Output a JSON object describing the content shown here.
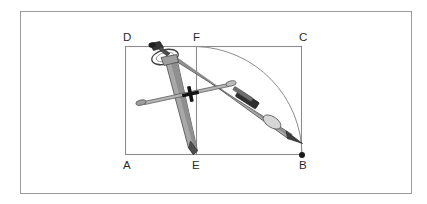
{
  "figure": {
    "background_color": "#ffffff",
    "border": {
      "name": "outer-frame",
      "color": "#9a9a9a",
      "x": 20,
      "y": 11,
      "width": 391,
      "height": 182
    },
    "rectangle": {
      "name": "rectangle-abcd",
      "stroke_color": "#8d8d8d",
      "left": 125,
      "top": 46,
      "right": 302,
      "bottom": 155
    },
    "segment_ef": {
      "name": "segment-ef",
      "stroke_color": "#8d8d8d",
      "x": 196,
      "y_top": 46,
      "y_bottom": 155
    },
    "arc": {
      "name": "compass-arc-fb",
      "stroke_color": "#8d8d8d",
      "center_label": "E",
      "from_label": "F",
      "to_label": "B",
      "center_x": 196,
      "center_y": 155,
      "radius": 109
    },
    "point_marker": {
      "name": "point-b-dot",
      "label": "B",
      "color": "#1a1a1a",
      "x": 302,
      "y": 155,
      "r": 3.0
    },
    "labels": [
      {
        "id": "label-d",
        "text": "D",
        "x": 123,
        "y": 41,
        "anchor": "start"
      },
      {
        "id": "label-f",
        "text": "F",
        "x": 193,
        "y": 41,
        "anchor": "start"
      },
      {
        "id": "label-c",
        "text": "C",
        "x": 299,
        "y": 41,
        "anchor": "start"
      },
      {
        "id": "label-a",
        "text": "A",
        "x": 123,
        "y": 169,
        "anchor": "start"
      },
      {
        "id": "label-e",
        "text": "E",
        "x": 192,
        "y": 169,
        "anchor": "start"
      },
      {
        "id": "label-b",
        "text": "B",
        "x": 299,
        "y": 169,
        "anchor": "start"
      }
    ],
    "compass": {
      "name": "drawing-compass",
      "needle_point_label": "E",
      "pencil_point_label": "B",
      "hinge_x": 168,
      "hinge_y": 55,
      "body_fill": "#a8a8a8",
      "body_fill_dark": "#8a8a8a",
      "body_fill_light": "#c9c9c9",
      "outline_color": "#4a4a4a",
      "knob_color": "#3a3a3a",
      "clamp_color": "#2f2f2f",
      "ferrule_color": "#d2d2d2",
      "parts": [
        {
          "id": "thumb-screw",
          "label": "thumb screw"
        },
        {
          "id": "hinge-ring",
          "label": "hinge ring"
        },
        {
          "id": "needle-leg",
          "label": "needle leg"
        },
        {
          "id": "pencil-leg",
          "label": "pencil leg"
        },
        {
          "id": "extension-bar",
          "label": "extension bar"
        },
        {
          "id": "cross-knob",
          "label": "cross knob"
        },
        {
          "id": "pencil-clamp",
          "label": "pencil clamp"
        },
        {
          "id": "pencil-ferrule",
          "label": "pencil ferrule"
        }
      ]
    }
  }
}
